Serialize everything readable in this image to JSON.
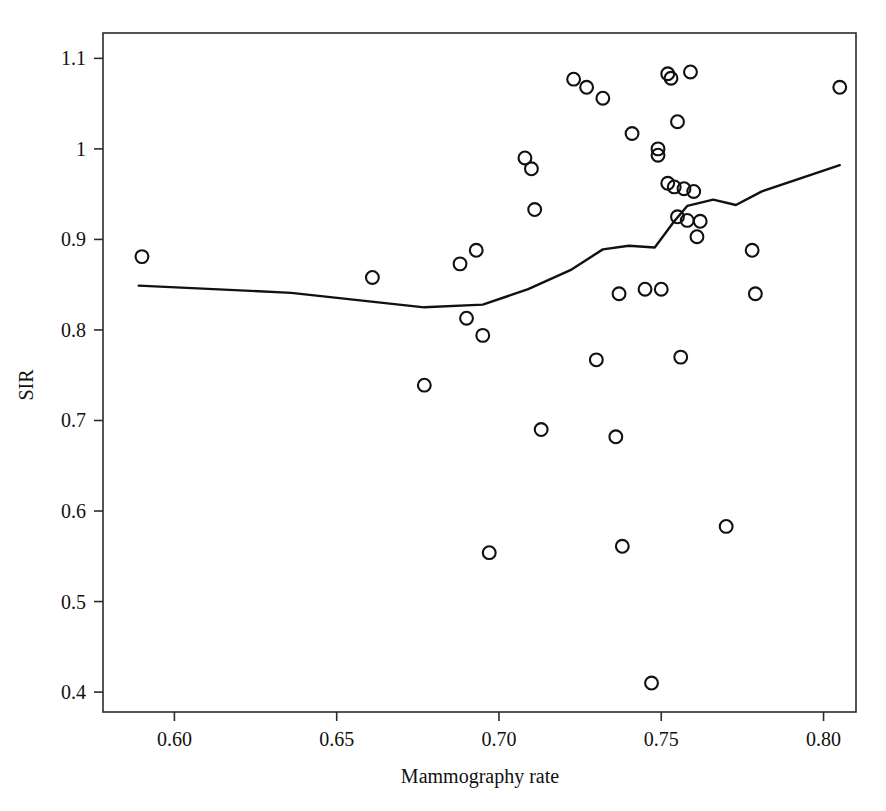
{
  "chart_data": {
    "type": "scatter",
    "title": "",
    "xlabel": "Mammography rate",
    "ylabel": "SIR",
    "xlim": [
      0.578,
      0.81
    ],
    "ylim": [
      0.378,
      1.128
    ],
    "grid": false,
    "legend": null,
    "xticks": [
      0.6,
      0.65,
      0.7,
      0.75,
      0.8
    ],
    "xtick_labels": [
      "0.60",
      "0.65",
      "0.70",
      "0.75",
      "0.80"
    ],
    "yticks": [
      0.4,
      0.5,
      0.6,
      0.7,
      0.8,
      0.9,
      1.0,
      1.1
    ],
    "ytick_labels": [
      "0.4",
      "0.5",
      "0.6",
      "0.7",
      "0.8",
      "0.9",
      "1",
      "1.1"
    ],
    "marker": "open-circle",
    "series": [
      {
        "name": "observations",
        "type": "scatter",
        "points": [
          [
            0.59,
            0.881
          ],
          [
            0.661,
            0.858
          ],
          [
            0.677,
            0.739
          ],
          [
            0.688,
            0.873
          ],
          [
            0.69,
            0.813
          ],
          [
            0.693,
            0.888
          ],
          [
            0.695,
            0.794
          ],
          [
            0.697,
            0.554
          ],
          [
            0.708,
            0.99
          ],
          [
            0.71,
            0.978
          ],
          [
            0.711,
            0.933
          ],
          [
            0.713,
            0.69
          ],
          [
            0.723,
            1.077
          ],
          [
            0.727,
            1.068
          ],
          [
            0.73,
            0.767
          ],
          [
            0.732,
            1.056
          ],
          [
            0.736,
            0.682
          ],
          [
            0.737,
            0.84
          ],
          [
            0.738,
            0.561
          ],
          [
            0.741,
            1.017
          ],
          [
            0.745,
            0.845
          ],
          [
            0.747,
            0.41
          ],
          [
            0.749,
            1.0
          ],
          [
            0.749,
            0.993
          ],
          [
            0.75,
            0.845
          ],
          [
            0.752,
            1.083
          ],
          [
            0.752,
            0.962
          ],
          [
            0.753,
            1.078
          ],
          [
            0.754,
            0.958
          ],
          [
            0.755,
            1.03
          ],
          [
            0.755,
            0.925
          ],
          [
            0.756,
            0.77
          ],
          [
            0.757,
            0.956
          ],
          [
            0.758,
            0.921
          ],
          [
            0.759,
            1.085
          ],
          [
            0.76,
            0.953
          ],
          [
            0.761,
            0.903
          ],
          [
            0.762,
            0.92
          ],
          [
            0.77,
            0.583
          ],
          [
            0.778,
            0.888
          ],
          [
            0.779,
            0.84
          ],
          [
            0.805,
            1.068
          ]
        ]
      },
      {
        "name": "smoother",
        "type": "line",
        "points": [
          [
            0.589,
            0.849
          ],
          [
            0.636,
            0.841
          ],
          [
            0.677,
            0.825
          ],
          [
            0.695,
            0.828
          ],
          [
            0.709,
            0.845
          ],
          [
            0.722,
            0.866
          ],
          [
            0.732,
            0.889
          ],
          [
            0.74,
            0.893
          ],
          [
            0.748,
            0.891
          ],
          [
            0.754,
            0.92
          ],
          [
            0.758,
            0.937
          ],
          [
            0.766,
            0.944
          ],
          [
            0.773,
            0.938
          ],
          [
            0.781,
            0.953
          ],
          [
            0.805,
            0.982
          ]
        ]
      }
    ]
  },
  "axes": {
    "x_title": "Mammography rate",
    "y_title": "SIR"
  }
}
